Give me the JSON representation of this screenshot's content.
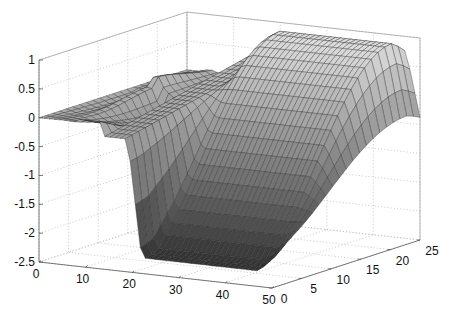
{
  "chart_data": {
    "type": "surface",
    "title": "",
    "xlabel": "",
    "ylabel": "",
    "zlabel": "",
    "x_ticks": [
      0,
      10,
      20,
      30,
      40,
      50
    ],
    "y_ticks": [
      0,
      5,
      10,
      15,
      20,
      25
    ],
    "z_ticks": [
      1,
      0.5,
      0,
      -0.5,
      -1,
      -1.5,
      -2,
      -2.5
    ],
    "xlim": [
      0,
      50
    ],
    "ylim": [
      0,
      25
    ],
    "zlim": [
      -2.5,
      1
    ],
    "grid": true,
    "colormap": "gray",
    "grid_size": {
      "nx": 46,
      "ny": 22
    },
    "surface_description": "Ridge near y≈22 at height ~0.95 along x≈15–20, sloping down toward y=0 where values reach about -2.2 across x≈20–48; irregular spiky region for x<22 with peak ~0.3 at x≈5 and a steep wall near x≈20"
  }
}
